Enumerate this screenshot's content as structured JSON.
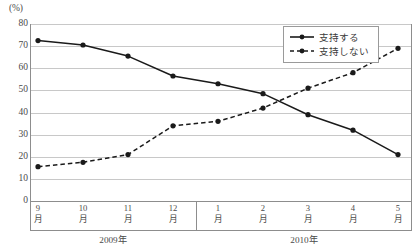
{
  "chart_data": {
    "type": "line",
    "title": "",
    "xlabel": "",
    "ylabel": "",
    "unit_label": "(%)",
    "ylim": [
      0,
      80
    ],
    "yticks": [
      80,
      70,
      60,
      50,
      40,
      30,
      20,
      10,
      0
    ],
    "grid": true,
    "legend_position": "top-right",
    "categories": [
      "9月",
      "10月",
      "11月",
      "12月",
      "1月",
      "2月",
      "3月",
      "4月",
      "5月"
    ],
    "category_lines": [
      [
        "9",
        "月"
      ],
      [
        "10",
        "月"
      ],
      [
        "11",
        "月"
      ],
      [
        "12",
        "月"
      ],
      [
        "1",
        "月"
      ],
      [
        "2",
        "月"
      ],
      [
        "3",
        "月"
      ],
      [
        "4",
        "月"
      ],
      [
        "5",
        "月"
      ]
    ],
    "group_labels": [
      {
        "label": "2009年",
        "center_x": 113,
        "from_index": 0,
        "to_index": 3
      },
      {
        "label": "2010年",
        "center_x": 304,
        "from_index": 4,
        "to_index": 8
      }
    ],
    "series": [
      {
        "name": "支持する",
        "style": "solid",
        "color": "#1a1a1a",
        "marker": "filled-circle",
        "values": [
          72.5,
          70.5,
          65.5,
          56.5,
          53.0,
          48.5,
          39.0,
          32.0,
          21.0
        ]
      },
      {
        "name": "支持しない",
        "style": "dashed",
        "color": "#1a1a1a",
        "marker": "filled-circle",
        "values": [
          15.5,
          17.5,
          21.0,
          34.0,
          36.0,
          42.0,
          51.0,
          58.0,
          69.0
        ]
      }
    ]
  },
  "legend": {
    "items": [
      {
        "label": "支持する",
        "style": "solid"
      },
      {
        "label": "支持しない",
        "style": "dashed"
      }
    ]
  }
}
